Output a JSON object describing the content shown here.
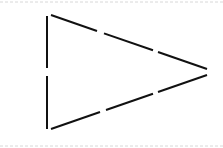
{
  "diagram": {
    "shape": "triangle",
    "orientation": "pointing-right",
    "stroke_color": "#111111",
    "guide_color": "#d8d8d8",
    "edges": [
      {
        "name": "left-edge",
        "segments": 2
      },
      {
        "name": "top-edge",
        "segments": 3
      },
      {
        "name": "bottom-edge",
        "segments": 3
      }
    ],
    "guides": [
      {
        "name": "top-guide-line",
        "style": "dashed"
      },
      {
        "name": "bottom-guide-line",
        "style": "dashed"
      }
    ]
  }
}
